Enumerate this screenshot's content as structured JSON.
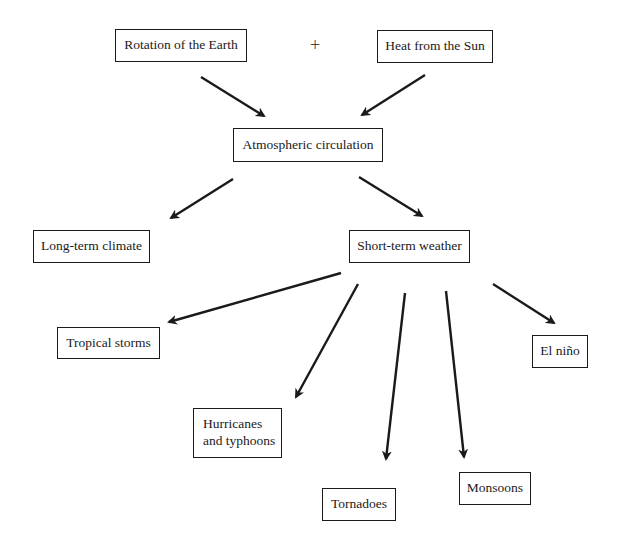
{
  "diagram": {
    "type": "flowchart",
    "operator": "+",
    "nodes": {
      "rotation": {
        "label": "Rotation of the Earth",
        "box": [
          115,
          29,
          132,
          33
        ]
      },
      "heat": {
        "label": "Heat from the Sun",
        "box": [
          377,
          30,
          116,
          33
        ]
      },
      "circulation": {
        "label": "Atmospheric circulation",
        "box": [
          233,
          128,
          150,
          34
        ]
      },
      "climate": {
        "label": "Long-term climate",
        "box": [
          33,
          230,
          117,
          33
        ]
      },
      "weather": {
        "label": "Short-term weather",
        "box": [
          349,
          230,
          121,
          33
        ]
      },
      "storms": {
        "label": "Tropical storms",
        "box": [
          57,
          327,
          103,
          32
        ]
      },
      "hurricanes": {
        "label_line1": "Hurricanes",
        "label_line2": "and typhoons",
        "box": [
          193,
          408,
          89,
          50
        ]
      },
      "tornadoes": {
        "label": "Tornadoes",
        "box": [
          322,
          488,
          74,
          33
        ]
      },
      "monsoons": {
        "label": "Monsoons",
        "box": [
          459,
          472,
          72,
          33
        ]
      },
      "elnino": {
        "label": "El niño",
        "box": [
          532,
          335,
          56,
          33
        ]
      }
    },
    "edges": [
      {
        "from": "rotation",
        "to": "circulation",
        "x1": 201,
        "y1": 77,
        "x2": 264,
        "y2": 116
      },
      {
        "from": "heat",
        "to": "circulation",
        "x1": 425,
        "y1": 75,
        "x2": 362,
        "y2": 115
      },
      {
        "from": "circulation",
        "to": "climate",
        "x1": 233,
        "y1": 179,
        "x2": 171,
        "y2": 218
      },
      {
        "from": "circulation",
        "to": "weather",
        "x1": 359,
        "y1": 177,
        "x2": 422,
        "y2": 216
      },
      {
        "from": "weather",
        "to": "storms",
        "x1": 341,
        "y1": 273,
        "x2": 169,
        "y2": 322
      },
      {
        "from": "weather",
        "to": "hurricanes",
        "x1": 358,
        "y1": 284,
        "x2": 296,
        "y2": 397
      },
      {
        "from": "weather",
        "to": "tornadoes",
        "x1": 405,
        "y1": 293,
        "x2": 386,
        "y2": 459
      },
      {
        "from": "weather",
        "to": "monsoons",
        "x1": 446,
        "y1": 291,
        "x2": 464,
        "y2": 457
      },
      {
        "from": "weather",
        "to": "elnino",
        "x1": 493,
        "y1": 284,
        "x2": 554,
        "y2": 323
      }
    ],
    "colors": {
      "stroke": "#1a1a1a",
      "text": "#1a1a1a",
      "background": "#ffffff"
    }
  }
}
